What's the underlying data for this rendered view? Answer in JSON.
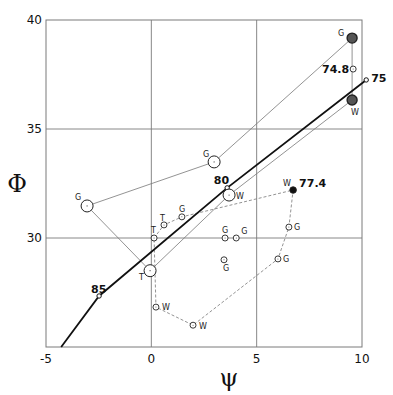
{
  "chart_data": {
    "type": "scatter",
    "title": "",
    "xlabel": "ψ",
    "ylabel": "Φ",
    "xlim": [
      -5,
      10
    ],
    "ylim": [
      25,
      40
    ],
    "grid": true,
    "x_ticks": [
      {
        "value": -5,
        "label": "-5"
      },
      {
        "value": 0,
        "label": "0"
      },
      {
        "value": 5,
        "label": "5"
      },
      {
        "value": 10,
        "label": "10"
      }
    ],
    "y_ticks": [
      {
        "value": 40,
        "label": "40"
      },
      {
        "value": 35,
        "label": "35"
      },
      {
        "value": 30,
        "label": "30"
      }
    ],
    "curve": {
      "name": "thick-curve",
      "points": [
        [
          10.2,
          37.25
        ],
        [
          3.6,
          32.3
        ],
        [
          -2.48,
          27.34
        ],
        [
          -4.28,
          25.0
        ]
      ],
      "markers": [
        {
          "x": 10.2,
          "y": 37.25,
          "label": "75"
        },
        {
          "x": 3.6,
          "y": 32.3,
          "label": "80"
        },
        {
          "x": -2.48,
          "y": 27.34,
          "label": "85"
        }
      ]
    },
    "large_points": [
      {
        "id": "G-left",
        "x": -3.05,
        "y": 31.47,
        "label": "G",
        "fill": "open"
      },
      {
        "id": "T-big",
        "x": -0.06,
        "y": 28.5,
        "label": "T",
        "fill": "open"
      },
      {
        "id": "G-mid",
        "x": 2.98,
        "y": 33.49,
        "label": "G",
        "fill": "open"
      },
      {
        "id": "W-mid",
        "x": 3.69,
        "y": 31.97,
        "label": "W",
        "fill": "open"
      },
      {
        "id": "G-right",
        "x": 9.53,
        "y": 39.17,
        "label": "G",
        "fill": "dark"
      },
      {
        "id": "W-right",
        "x": 9.53,
        "y": 36.33,
        "label": "W",
        "fill": "dark"
      }
    ],
    "thin_lines": [
      [
        "G-left",
        "G-mid"
      ],
      [
        "G-mid",
        "G-right"
      ],
      [
        "G-left",
        "T-big"
      ],
      [
        "T-big",
        "W-mid"
      ],
      [
        "W-mid",
        "W-right"
      ],
      [
        "G-right",
        "W-right"
      ]
    ],
    "small_points": [
      {
        "x": 0.13,
        "y": 30.0,
        "label": "T"
      },
      {
        "x": 0.6,
        "y": 30.6,
        "label": "T"
      },
      {
        "x": 1.45,
        "y": 30.97,
        "label": "G"
      },
      {
        "x": 6.73,
        "y": 32.2,
        "label": "W",
        "annotation": "77.4",
        "fill": "black"
      },
      {
        "x": 6.53,
        "y": 30.5,
        "label": "G"
      },
      {
        "x": 6.01,
        "y": 29.04,
        "label": "G"
      },
      {
        "x": 1.98,
        "y": 26.0,
        "label": "W"
      },
      {
        "x": 0.22,
        "y": 26.83,
        "label": "W"
      },
      {
        "x": 3.5,
        "y": 30.0,
        "label": "G"
      },
      {
        "x": 4.03,
        "y": 30.0,
        "label": "G"
      },
      {
        "x": 3.45,
        "y": 29.0,
        "label": "G"
      },
      {
        "x": 9.58,
        "y": 37.75,
        "label": "",
        "annotation": "74.8"
      }
    ],
    "dashed_path": [
      [
        0.13,
        30.0
      ],
      [
        0.6,
        30.6
      ],
      [
        1.45,
        30.97
      ],
      [
        6.73,
        32.2
      ],
      [
        6.53,
        30.5
      ],
      [
        6.01,
        29.04
      ],
      [
        1.98,
        26.0
      ],
      [
        0.22,
        26.83
      ],
      [
        0.13,
        30.0
      ]
    ]
  }
}
